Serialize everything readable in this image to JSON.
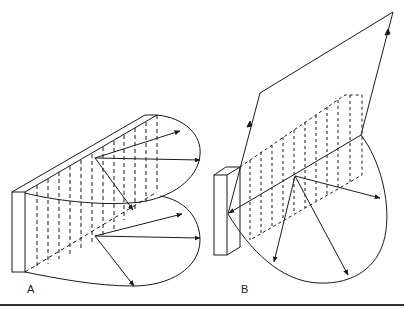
{
  "figure": {
    "panels": [
      {
        "id": "A",
        "label": "A",
        "description": "Planar array with two radiation lobes (bidirectional end-fire pattern) shown in perspective, arrows from array to lobe boundary"
      },
      {
        "id": "B",
        "label": "B",
        "description": "Planar array with reflected incoming ray path and single radiation lobe, arrows from array center to lobe boundary"
      }
    ],
    "colors": {
      "line": "#1a1a1a",
      "background": "#ffffff",
      "rule": "#333333"
    }
  }
}
